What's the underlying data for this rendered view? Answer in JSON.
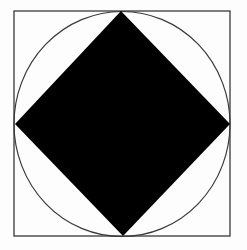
{
  "diagram": {
    "colors": {
      "background": "#fdfdfd",
      "square_stroke": "#3a3a3a",
      "circle_stroke": "#3a3a3a",
      "diamond_fill": "#000000"
    },
    "square": {
      "x": 14,
      "y": 11,
      "width": 216,
      "height": 225,
      "stroke_width": 1.3
    },
    "circle": {
      "cx": 122,
      "cy": 124,
      "rx": 108,
      "ry": 112.5,
      "stroke_width": 1.2
    },
    "diamond": {
      "points": [
        [
          121,
          11
        ],
        [
          230,
          124
        ],
        [
          123,
          236
        ],
        [
          15,
          124
        ]
      ]
    }
  }
}
